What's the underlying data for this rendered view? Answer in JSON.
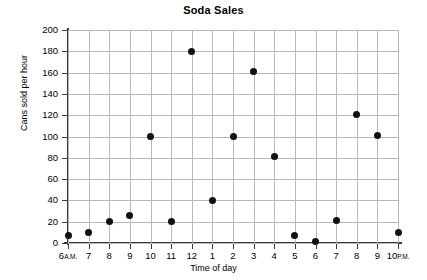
{
  "chart_data": {
    "type": "scatter",
    "title": "Soda Sales",
    "xlabel": "Time of day",
    "ylabel": "Cans sold per hour",
    "xlim": [
      6,
      22
    ],
    "ylim": [
      0,
      200
    ],
    "grid": true,
    "legend": null,
    "x_tick_labels": [
      "6A.M.",
      "7",
      "8",
      "9",
      "10",
      "11",
      "12",
      "1",
      "2",
      "3",
      "4",
      "5",
      "6",
      "7",
      "8",
      "9",
      "10P.M."
    ],
    "x_tick_values": [
      6,
      7,
      8,
      9,
      10,
      11,
      12,
      13,
      14,
      15,
      16,
      17,
      18,
      19,
      20,
      21,
      22
    ],
    "y_tick_labels": [
      "0",
      "20",
      "40",
      "60",
      "80",
      "100",
      "120",
      "140",
      "160",
      "180",
      "200"
    ],
    "y_tick_values": [
      0,
      20,
      40,
      60,
      80,
      100,
      120,
      140,
      160,
      180,
      200
    ],
    "points": [
      {
        "label": "6A.M.",
        "x": 6,
        "y": 7
      },
      {
        "label": "7A.M.",
        "x": 7,
        "y": 10
      },
      {
        "label": "8A.M.",
        "x": 8,
        "y": 20
      },
      {
        "label": "9A.M.",
        "x": 9,
        "y": 26
      },
      {
        "label": "10A.M.",
        "x": 10,
        "y": 100
      },
      {
        "label": "11A.M.",
        "x": 11,
        "y": 20
      },
      {
        "label": "12P.M.",
        "x": 12,
        "y": 180
      },
      {
        "label": "1P.M.",
        "x": 13,
        "y": 40
      },
      {
        "label": "2P.M.",
        "x": 14,
        "y": 100
      },
      {
        "label": "3P.M.",
        "x": 15,
        "y": 161
      },
      {
        "label": "4P.M.",
        "x": 16,
        "y": 81
      },
      {
        "label": "5P.M.",
        "x": 17,
        "y": 7
      },
      {
        "label": "6P.M.",
        "x": 18,
        "y": 1
      },
      {
        "label": "7P.M.",
        "x": 19,
        "y": 21
      },
      {
        "label": "8P.M.",
        "x": 20,
        "y": 121
      },
      {
        "label": "9P.M.",
        "x": 21,
        "y": 101
      },
      {
        "label": "10P.M.",
        "x": 22,
        "y": 10
      }
    ],
    "colors": {
      "point": "#111111",
      "grid": "#b8b8b8",
      "axis": "#3a3a3a",
      "text": "#000000",
      "background": "#ffffff"
    }
  }
}
